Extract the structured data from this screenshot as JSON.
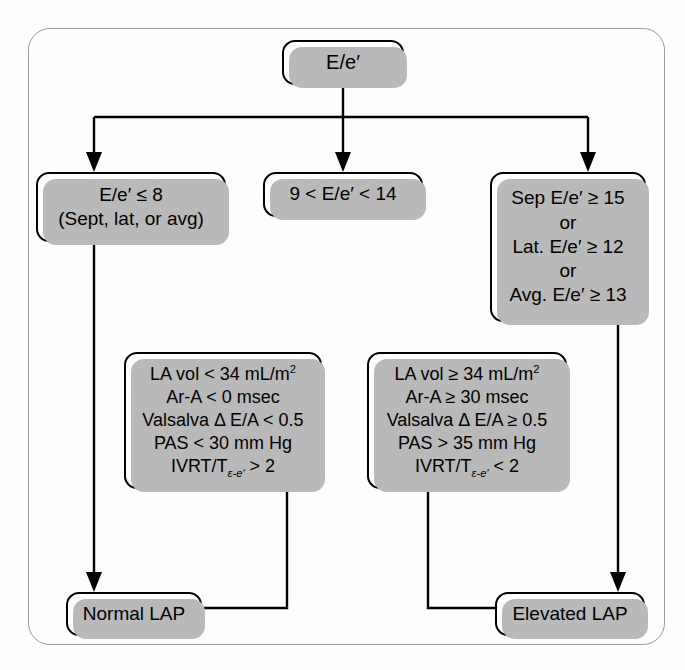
{
  "diagram": {
    "frame_color": "#9a9a9a",
    "box_border_color": "#000000",
    "shadow_color": "#b9b9b9",
    "background": "#fdfdfd"
  },
  "nodes": {
    "root": {
      "id": "root",
      "lines": [
        "E/e′"
      ]
    },
    "low": {
      "id": "low",
      "lines": [
        "E/e′ ≤ 8",
        "(Sept, lat, or avg)"
      ]
    },
    "mid": {
      "id": "mid",
      "lines": [
        "9 < E/e′ < 14"
      ]
    },
    "high": {
      "id": "high",
      "lines": [
        "Sep E/e′ ≥ 15",
        "or",
        "Lat. E/e′ ≥ 12",
        "or",
        "Avg. E/e′ ≥ 13"
      ]
    },
    "criteria_normal": {
      "id": "criteria-normal",
      "lines": [
        "LA vol < 34 mL/m",
        "Ar-A < 0 msec",
        "Valsalva Δ E/A < 0.5",
        "PAS < 30 mm Hg",
        "IVRT/T"
      ],
      "line1_exponent": "2",
      "line5_subscript": "ε-e′",
      "line5_tail": " > 2"
    },
    "criteria_elevated": {
      "id": "criteria-elevated",
      "lines": [
        "LA vol ≥ 34 mL/m",
        "Ar-A ≥ 30 msec",
        "Valsalva Δ E/A ≥ 0.5",
        "PAS > 35 mm Hg",
        "IVRT/T"
      ],
      "line1_exponent": "2",
      "line5_subscript": "ε-e′",
      "line5_tail": " < 2"
    },
    "normal_lap": {
      "id": "normal-lap",
      "lines": [
        "Normal LAP"
      ]
    },
    "elevated_lap": {
      "id": "elevated-lap",
      "lines": [
        "Elevated LAP"
      ]
    }
  }
}
